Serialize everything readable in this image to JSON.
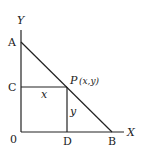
{
  "diagram": {
    "axis_labels": {
      "x": "X",
      "y": "Y"
    },
    "points": {
      "origin": "0",
      "A": "A",
      "B": "B",
      "C": "C",
      "D": "D",
      "P": "P",
      "P_coords": "(x,y)"
    },
    "segment_labels": {
      "horizontal": "x",
      "vertical": "y"
    }
  }
}
